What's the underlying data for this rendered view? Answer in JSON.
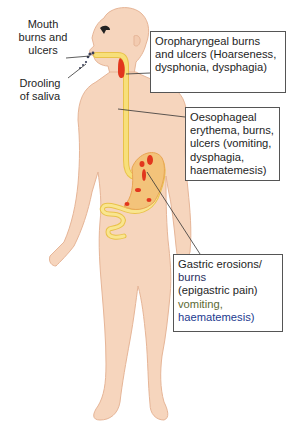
{
  "diagram": {
    "colors": {
      "skin": "#f6d5bd",
      "skin_outline": "#e6b597",
      "tract": "#f7df7a",
      "tract_outline": "#e9c24a",
      "lesion": "#e2361d",
      "stomach": "#f3c37a",
      "box_border": "#555555",
      "leader_line": "#333333"
    },
    "left_labels": [
      {
        "id": "mouth",
        "lines": [
          "Mouth",
          "burns and",
          "ulcers"
        ]
      },
      {
        "id": "drooling",
        "lines": [
          "Drooling",
          "of saliva"
        ]
      }
    ],
    "callouts": [
      {
        "id": "oropharyngeal",
        "lines": [
          "Oropharyngeal burns",
          "and ulcers (Hoarseness,",
          "dysphonia, dysphagia)"
        ]
      },
      {
        "id": "oesophageal",
        "lines": [
          "Oesophageal",
          "erythema, burns,",
          "ulcers (vomiting,",
          "dysphagia,",
          "haematemesis)"
        ]
      },
      {
        "id": "gastric",
        "lines": [
          "Gastric erosions/",
          "burns",
          "(epigastric pain)",
          "vomiting,",
          "haematemesis)"
        ]
      }
    ]
  }
}
